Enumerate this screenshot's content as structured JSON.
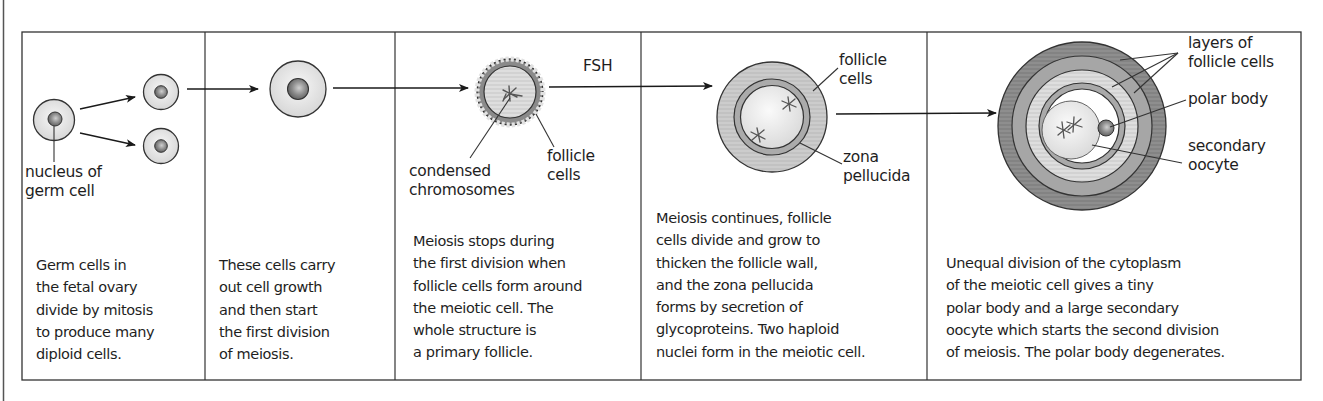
{
  "figure": {
    "colors": {
      "line": "#3a3a3a",
      "cytoplasm_light": "#e6e6e6",
      "nucleus": "#7a7a7a",
      "follicle_light": "#cfcfcf",
      "follicle_mid": "#a9a9a9",
      "follicle_dark": "#8c8c8c",
      "zona": "#b0b0b0"
    },
    "panels": [
      {
        "id": "germ-cells",
        "labels": [
          "nucleus of\ngerm cell"
        ],
        "description": "Germ cells in\nthe fetal ovary\ndivide by mitosis\nto produce many\ndiploid cells."
      },
      {
        "id": "cell-growth",
        "labels": [],
        "description": "These cells carry\nout cell growth\nand then start\nthe first division\nof meiosis."
      },
      {
        "id": "primary-follicle",
        "labels": [
          "condensed\nchromosomes",
          "follicle\ncells"
        ],
        "arrow_label": "FSH",
        "description": "Meiosis stops during\nthe first division when\nfollicle cells form around\nthe meiotic cell. The\nwhole structure is\na primary follicle."
      },
      {
        "id": "growing-follicle",
        "labels": [
          "follicle\ncells",
          "zona\npellucida"
        ],
        "description": "Meiosis continues, follicle\ncells divide and grow to\nthicken the follicle wall,\nand the zona pellucida\nforms by secretion of\nglycoproteins. Two haploid\nnuclei form in the meiotic cell."
      },
      {
        "id": "mature-follicle",
        "labels": [
          "layers of\nfollicle cells",
          "polar body",
          "secondary\noocyte"
        ],
        "description": "Unequal division of the cytoplasm\nof the meiotic cell gives a tiny\npolar body and a large secondary\noocyte which starts the second division\nof meiosis. The polar body degenerates."
      }
    ]
  }
}
